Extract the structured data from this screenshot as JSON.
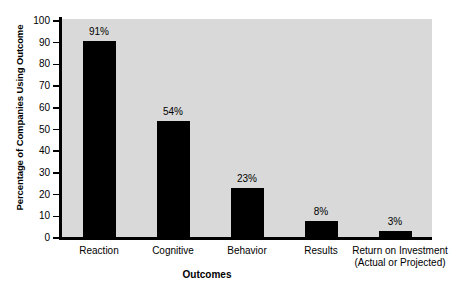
{
  "chart_data": {
    "type": "bar",
    "title": "",
    "subtitle": "",
    "xlabel": "Outcomes",
    "ylabel": "Percentage of Companies Using Outcome",
    "categories": [
      "Reaction",
      "Cognitive",
      "Behavior",
      "Results",
      "Return on Investment\n(Actual or Projected)"
    ],
    "category_lines": [
      [
        "Reaction"
      ],
      [
        "Cognitive"
      ],
      [
        "Behavior"
      ],
      [
        "Results"
      ],
      [
        "Return on Investment",
        "(Actual or Projected)"
      ]
    ],
    "values": [
      91,
      54,
      23,
      8,
      3
    ],
    "data_labels": [
      "91%",
      "54%",
      "23%",
      "8%",
      "3%"
    ],
    "ylim": [
      0,
      100
    ],
    "ytick_labels": [
      "0",
      "10",
      "20",
      "30",
      "40",
      "50",
      "60",
      "70",
      "80",
      "90",
      "100"
    ],
    "ytick_values": [
      0,
      10,
      20,
      30,
      40,
      50,
      60,
      70,
      80,
      90,
      100
    ],
    "grid": false,
    "legend": false,
    "legend_position": "none",
    "colors": {
      "bar": "#000000",
      "plot_background": "#d9d9d9",
      "axis": "#000000",
      "figure_background": "#ffffff",
      "text": "#000000"
    }
  }
}
